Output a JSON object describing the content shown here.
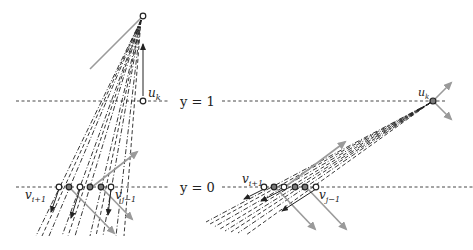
{
  "labels": {
    "y1": "y = 1",
    "y0": "y = 0",
    "left_uk": "u",
    "left_uk_sub": "k",
    "left_vi": "v",
    "left_vi_sub": "i+1",
    "left_vj": "v",
    "left_vj_sub": "j−1",
    "right_uk": "u",
    "right_uk_sub": "k",
    "right_vi": "v",
    "right_vi_sub": "i+1",
    "right_vj": "v",
    "right_vj_sub": "j−1"
  },
  "colors": {
    "line": "#222222",
    "gray_arrow": "#9a9a9a",
    "filled_node": "#7a7a7a",
    "open_node": "#ffffff"
  },
  "levels": {
    "y1_px": 101,
    "y0_px": 187
  },
  "left_panel": {
    "top_node": [
      143,
      16
    ],
    "uk_node": [
      143,
      101
    ],
    "bottom_nodes": [
      {
        "x": 59,
        "filled": false
      },
      {
        "x": 69,
        "filled": true
      },
      {
        "x": 80,
        "filled": false
      },
      {
        "x": 90,
        "filled": true
      },
      {
        "x": 101,
        "filled": true
      },
      {
        "x": 111,
        "filled": false
      }
    ]
  },
  "right_panel": {
    "uk_node": [
      433,
      101
    ],
    "bottom_nodes": [
      {
        "x": 264,
        "filled": false
      },
      {
        "x": 274,
        "filled": true
      },
      {
        "x": 284,
        "filled": false
      },
      {
        "x": 295,
        "filled": true
      },
      {
        "x": 305,
        "filled": true
      },
      {
        "x": 316,
        "filled": false
      }
    ]
  }
}
